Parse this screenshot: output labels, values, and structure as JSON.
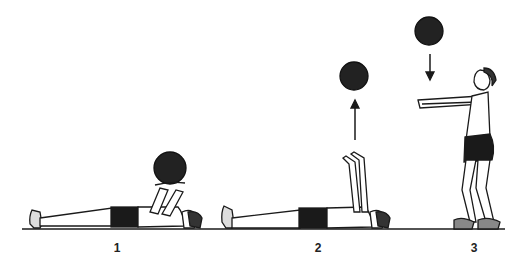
{
  "figure": {
    "steps": [
      {
        "label": "1",
        "x": 117
      },
      {
        "label": "2",
        "x": 318
      },
      {
        "label": "3",
        "x": 474
      }
    ],
    "colors": {
      "ink": "#1a1a1a",
      "ball": "#222222",
      "background": "#ffffff"
    }
  }
}
